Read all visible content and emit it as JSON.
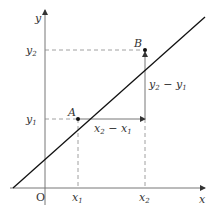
{
  "diagram": {
    "axes": {
      "x_label": "x",
      "y_label": "y",
      "origin_label": "O"
    },
    "points": [
      {
        "name": "A",
        "x_label": "x",
        "x_sub": "1",
        "y_label": "y",
        "y_sub": "1"
      },
      {
        "name": "B",
        "x_label": "x",
        "x_sub": "2",
        "y_label": "y",
        "y_sub": "2"
      }
    ],
    "annotations": {
      "dx": {
        "a": "x",
        "a_sub": "2",
        "op": " − ",
        "b": "x",
        "b_sub": "1"
      },
      "dy": {
        "a": "y",
        "a_sub": "2",
        "op": " − ",
        "b": "y",
        "b_sub": "1"
      }
    },
    "colors": {
      "line": "#111111",
      "axis": "#777777",
      "dashed": "#888888",
      "text": "#333333"
    }
  }
}
